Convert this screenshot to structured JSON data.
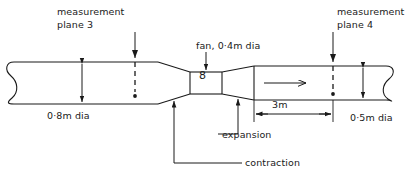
{
  "diagram": {
    "type": "engineering-schematic",
    "colors": {
      "line": "#1a1a1a",
      "background": "#ffffff"
    },
    "labels": {
      "measurement_plane_3_line1": "measurement",
      "measurement_plane_3_line2": "plane 3",
      "measurement_plane_4_line1": "measurement",
      "measurement_plane_4_line2": "plane 4",
      "fan": "fan, 0·4m dia",
      "fan_symbol": "8",
      "upstream_diameter": "0·8m dia",
      "downstream_diameter": "0·5m dia",
      "length_dimension": "3m",
      "expansion": "expansion",
      "contraction": "contraction"
    },
    "icons": {
      "flow_direction": "right-arrow-icon",
      "break_left": "break-line-icon",
      "break_right": "break-line-icon"
    },
    "dimensions": {
      "upstream_dia_m": 0.8,
      "fan_dia_m": 0.4,
      "downstream_dia_m": 0.5,
      "downstream_length_m": 3
    }
  }
}
